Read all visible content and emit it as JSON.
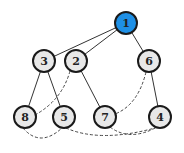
{
  "diagram": {
    "type": "tree-with-cross-links",
    "node_radius": 11,
    "colors": {
      "root_fill": "#1e90e6",
      "node_fill": "#e8e8e8",
      "stroke": "#1a1a1a"
    },
    "nodes": [
      {
        "id": "1",
        "label": "1",
        "x": 126,
        "y": 23,
        "highlighted": true
      },
      {
        "id": "3",
        "label": "3",
        "x": 44,
        "y": 61,
        "highlighted": false
      },
      {
        "id": "2",
        "label": "2",
        "x": 76,
        "y": 61,
        "highlighted": false
      },
      {
        "id": "6",
        "label": "6",
        "x": 149,
        "y": 61,
        "highlighted": false
      },
      {
        "id": "8",
        "label": "8",
        "x": 25,
        "y": 117,
        "highlighted": false
      },
      {
        "id": "5",
        "label": "5",
        "x": 64,
        "y": 117,
        "highlighted": false
      },
      {
        "id": "7",
        "label": "7",
        "x": 105,
        "y": 117,
        "highlighted": false
      },
      {
        "id": "4",
        "label": "4",
        "x": 160,
        "y": 117,
        "highlighted": false
      }
    ],
    "solid_edges": [
      {
        "from": "1",
        "to": "3"
      },
      {
        "from": "1",
        "to": "2"
      },
      {
        "from": "1",
        "to": "6"
      },
      {
        "from": "3",
        "to": "8"
      },
      {
        "from": "3",
        "to": "5"
      },
      {
        "from": "2",
        "to": "7"
      },
      {
        "from": "6",
        "to": "4"
      }
    ],
    "dashed_edges": [
      {
        "from": "2",
        "to": "8",
        "path": "M 70 71 Q 62 100 35 115"
      },
      {
        "from": "6",
        "to": "7",
        "path": "M 146 72 Q 138 105 115 114"
      },
      {
        "from": "8",
        "to": "5",
        "path": "M 23 128 Q 40 148 62 128"
      },
      {
        "from": "5",
        "to": "4",
        "path": "M 66 128 Q 100 143 155 128"
      },
      {
        "from": "7",
        "to": "4",
        "path": "M 110 127 Q 130 142 157 127"
      }
    ]
  }
}
